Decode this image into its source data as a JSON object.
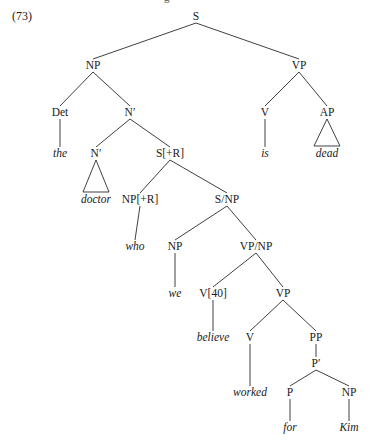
{
  "example_number": "(73)",
  "cut_top_text": "g",
  "nodes": [
    {
      "id": "S",
      "label": "S",
      "x": 196,
      "y": 20,
      "word": false
    },
    {
      "id": "NP1",
      "label": "NP",
      "x": 93,
      "y": 69,
      "word": false
    },
    {
      "id": "VP1",
      "label": "VP",
      "x": 299,
      "y": 69,
      "word": false
    },
    {
      "id": "Det",
      "label": "Det",
      "x": 60,
      "y": 116,
      "word": false
    },
    {
      "id": "Nbar1",
      "label": "Nʹ",
      "x": 130,
      "y": 116,
      "word": false
    },
    {
      "id": "V1",
      "label": "V",
      "x": 265,
      "y": 116,
      "word": false
    },
    {
      "id": "AP",
      "label": "AP",
      "x": 327,
      "y": 116,
      "word": false
    },
    {
      "id": "the",
      "label": "the",
      "x": 60,
      "y": 157,
      "word": true
    },
    {
      "id": "Nbar2",
      "label": "Nʹ",
      "x": 96,
      "y": 157,
      "word": false
    },
    {
      "id": "SR",
      "label": "S[+R]",
      "x": 170,
      "y": 157,
      "word": false
    },
    {
      "id": "is",
      "label": "is",
      "x": 265,
      "y": 157,
      "word": true
    },
    {
      "id": "dead",
      "label": "dead",
      "x": 327,
      "y": 157,
      "word": true
    },
    {
      "id": "doctor",
      "label": "doctor",
      "x": 96,
      "y": 203,
      "word": true
    },
    {
      "id": "NPR",
      "label": "NP[+R]",
      "x": 140,
      "y": 203,
      "word": false
    },
    {
      "id": "SNP",
      "label": "S/NP",
      "x": 227,
      "y": 203,
      "word": false
    },
    {
      "id": "who",
      "label": "who",
      "x": 135,
      "y": 250,
      "word": true
    },
    {
      "id": "NP2",
      "label": "NP",
      "x": 175,
      "y": 250,
      "word": false
    },
    {
      "id": "VPNP",
      "label": "VP/NP",
      "x": 256,
      "y": 250,
      "word": false
    },
    {
      "id": "we",
      "label": "we",
      "x": 175,
      "y": 297,
      "word": true
    },
    {
      "id": "V40",
      "label": "V[40]",
      "x": 213,
      "y": 297,
      "word": false
    },
    {
      "id": "VP2",
      "label": "VP",
      "x": 283,
      "y": 297,
      "word": false
    },
    {
      "id": "believe",
      "label": "believe",
      "x": 213,
      "y": 341,
      "word": true
    },
    {
      "id": "V2",
      "label": "V",
      "x": 250,
      "y": 341,
      "word": false
    },
    {
      "id": "PP",
      "label": "PP",
      "x": 316,
      "y": 341,
      "word": false
    },
    {
      "id": "Pbar",
      "label": "Pʹ",
      "x": 316,
      "y": 367,
      "word": false
    },
    {
      "id": "worked",
      "label": "worked",
      "x": 250,
      "y": 396,
      "word": true
    },
    {
      "id": "P",
      "label": "P",
      "x": 290,
      "y": 396,
      "word": false
    },
    {
      "id": "NP3",
      "label": "NP",
      "x": 349,
      "y": 396,
      "word": false
    },
    {
      "id": "for",
      "label": "for",
      "x": 290,
      "y": 431,
      "word": true
    },
    {
      "id": "Kim",
      "label": "Kim",
      "x": 349,
      "y": 431,
      "word": true
    }
  ],
  "edges": [
    [
      "S",
      "NP1"
    ],
    [
      "S",
      "VP1"
    ],
    [
      "NP1",
      "Det"
    ],
    [
      "NP1",
      "Nbar1"
    ],
    [
      "VP1",
      "V1"
    ],
    [
      "VP1",
      "AP"
    ],
    [
      "Det",
      "the"
    ],
    [
      "Nbar1",
      "Nbar2"
    ],
    [
      "Nbar1",
      "SR"
    ],
    [
      "V1",
      "is"
    ],
    [
      "SR",
      "NPR"
    ],
    [
      "SR",
      "SNP"
    ],
    [
      "NPR",
      "who"
    ],
    [
      "SNP",
      "NP2"
    ],
    [
      "SNP",
      "VPNP"
    ],
    [
      "NP2",
      "we"
    ],
    [
      "VPNP",
      "V40"
    ],
    [
      "VPNP",
      "VP2"
    ],
    [
      "V40",
      "believe"
    ],
    [
      "VP2",
      "V2"
    ],
    [
      "VP2",
      "PP"
    ],
    [
      "V2",
      "worked"
    ],
    [
      "PP",
      "Pbar"
    ],
    [
      "Pbar",
      "P"
    ],
    [
      "Pbar",
      "NP3"
    ],
    [
      "P",
      "for"
    ],
    [
      "NP3",
      "Kim"
    ]
  ],
  "triangles": [
    [
      "Nbar2",
      "doctor"
    ],
    [
      "AP",
      "dead"
    ]
  ]
}
